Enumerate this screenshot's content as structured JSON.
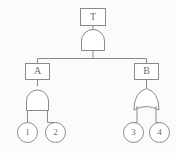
{
  "diagram": {
    "type": "fault-tree",
    "title": "",
    "colors": {
      "stroke": "#8a8a8a",
      "fill": "#ffffff",
      "text": "#6e6e6e",
      "background": "#fbfbfb"
    },
    "top_event": {
      "id": "T",
      "label": "T",
      "shape": "rectangle",
      "gate": "AND"
    },
    "intermediate_events": [
      {
        "id": "A",
        "label": "A",
        "shape": "rectangle",
        "gate": "AND",
        "side": "left"
      },
      {
        "id": "B",
        "label": "B",
        "shape": "rectangle",
        "gate": "OR",
        "side": "right"
      }
    ],
    "basic_events": [
      {
        "id": "e1",
        "label": "1",
        "shape": "circle",
        "parent": "A"
      },
      {
        "id": "e2",
        "label": "2",
        "shape": "circle",
        "parent": "A"
      },
      {
        "id": "e3",
        "label": "3",
        "shape": "circle",
        "parent": "B"
      },
      {
        "id": "e4",
        "label": "4",
        "shape": "circle",
        "parent": "B"
      }
    ],
    "gates": [
      {
        "id": "gate-top",
        "type": "AND",
        "output": "T",
        "inputs": [
          "A",
          "B"
        ]
      },
      {
        "id": "gate-a",
        "type": "AND",
        "output": "A",
        "inputs": [
          "1",
          "2"
        ]
      },
      {
        "id": "gate-b",
        "type": "OR",
        "output": "B",
        "inputs": [
          "3",
          "4"
        ]
      }
    ]
  }
}
